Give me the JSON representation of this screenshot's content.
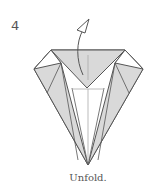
{
  "step": {
    "number": "4",
    "caption": "Unfold."
  },
  "diagram": {
    "action": "unfold",
    "arrow": "curved-unfold-arrow-up",
    "colors": {
      "paper_back": "#d9d9d9",
      "paper_front": "#ffffff",
      "edge": "#555555",
      "crease": "#aaaaaa"
    }
  }
}
